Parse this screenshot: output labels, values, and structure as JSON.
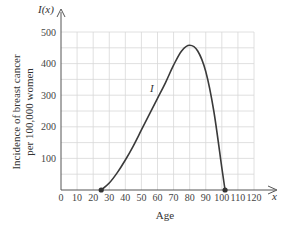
{
  "chart_data": {
    "type": "line",
    "title": "",
    "xlabel": "Age",
    "ylabel": "Incidence of breast cancer per 100,000 women",
    "ylabel_lines": [
      "Incidence of breast cancer",
      "per 100,000 women"
    ],
    "x_axis_symbol": "x",
    "y_axis_symbol": "I(x)",
    "curve_label": "I",
    "xlim": [
      0,
      120
    ],
    "ylim": [
      0,
      500
    ],
    "x_ticks": [
      0,
      10,
      20,
      30,
      40,
      50,
      60,
      70,
      80,
      90,
      100,
      110,
      120
    ],
    "x_tick_labels": [
      "0",
      "10",
      "20",
      "30",
      "40",
      "50",
      "60",
      "70",
      "80",
      "90",
      "100",
      "110",
      "120"
    ],
    "y_ticks": [
      100,
      200,
      300,
      400,
      500
    ],
    "y_tick_labels": [
      "100",
      "200",
      "300",
      "400",
      "500"
    ],
    "grid": true,
    "grid_x_step": 10,
    "grid_y_step": 50,
    "legend": null,
    "series": [
      {
        "name": "I",
        "x": [
          25,
          30,
          35,
          40,
          45,
          50,
          55,
          60,
          65,
          70,
          75,
          80,
          85,
          90,
          95,
          100,
          102
        ],
        "values": [
          0,
          22,
          55,
          95,
          140,
          190,
          240,
          290,
          340,
          395,
          440,
          458,
          440,
          375,
          250,
          70,
          0
        ]
      }
    ],
    "endpoints": [
      {
        "x": 25,
        "y": 0
      },
      {
        "x": 102,
        "y": 0
      }
    ],
    "colors": {
      "curve": "#3a3a3a",
      "grid": "#d8d8d8",
      "axis": "#555555"
    }
  }
}
